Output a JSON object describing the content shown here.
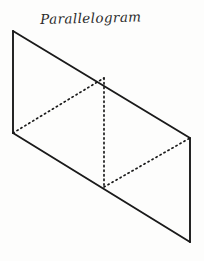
{
  "figure": {
    "title": "Parallelogram",
    "background_color": "#fdfdfc",
    "ink_color": "#1a1a1a",
    "style": "hand-drawn geometry textbook illustration",
    "canvas": {
      "width": 204,
      "height": 261
    }
  },
  "geometry": {
    "type": "diagram",
    "shape": "parallelogram",
    "vertices": [
      {
        "label": "top-left",
        "name": "A",
        "x": 13,
        "y": 31
      },
      {
        "label": "top-right",
        "name": "B",
        "x": 190,
        "y": 138
      },
      {
        "label": "bottom-right",
        "name": "C",
        "x": 190,
        "y": 242
      },
      {
        "label": "bottom-left",
        "name": "D",
        "x": 13,
        "y": 133
      }
    ],
    "interior_points": [
      {
        "label": "top-midpoint",
        "name": "M",
        "x": 104,
        "y": 78
      },
      {
        "label": "bottom-midpoint",
        "name": "N",
        "x": 104,
        "y": 187
      }
    ],
    "solid_edges": [
      {
        "name": "top-edge",
        "from": "A",
        "to": "B",
        "x1": 13,
        "y1": 31,
        "x2": 190,
        "y2": 138,
        "stroke_width": 1.9
      },
      {
        "name": "right-edge",
        "from": "B",
        "to": "C",
        "x1": 190,
        "y1": 138,
        "x2": 190,
        "y2": 242,
        "stroke_width": 1.9
      },
      {
        "name": "bottom-edge",
        "from": "C",
        "to": "D",
        "x1": 190,
        "y1": 242,
        "x2": 13,
        "y2": 133,
        "stroke_width": 1.9
      },
      {
        "name": "left-edge",
        "from": "D",
        "to": "A",
        "x1": 13,
        "y1": 133,
        "x2": 13,
        "y2": 31,
        "stroke_width": 1.9
      }
    ],
    "dotted_lines": [
      {
        "name": "left-diagonal",
        "from": "D",
        "to": "M",
        "x1": 13,
        "y1": 133,
        "x2": 104,
        "y2": 78,
        "dash": "1.3 3.3",
        "stroke_width": 1.7
      },
      {
        "name": "center-vertical",
        "from": "M",
        "to": "N",
        "x1": 104,
        "y1": 78,
        "x2": 104,
        "y2": 187,
        "dash": "1.3 3.3",
        "stroke_width": 1.7
      },
      {
        "name": "right-diagonal",
        "from": "N",
        "to": "B",
        "x1": 104,
        "y1": 187,
        "x2": 190,
        "y2": 138,
        "dash": "1.3 3.3",
        "stroke_width": 1.7
      }
    ]
  }
}
